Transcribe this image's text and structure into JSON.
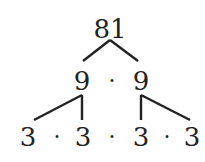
{
  "diagram": {
    "type": "factor-tree",
    "root": "81",
    "level1": [
      "9",
      "9"
    ],
    "level2": [
      "3",
      "3",
      "3",
      "3"
    ],
    "separator": "·"
  }
}
